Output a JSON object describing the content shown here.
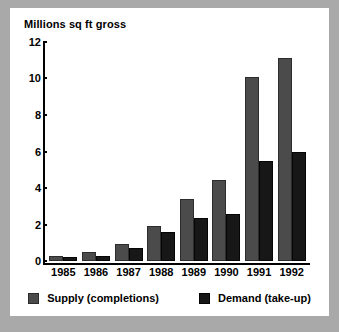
{
  "chart_data": {
    "type": "bar",
    "title": "Millions sq ft gross",
    "xlabel": "",
    "ylabel": "",
    "categories": [
      "1985",
      "1986",
      "1987",
      "1988",
      "1989",
      "1990",
      "1991",
      "1992"
    ],
    "series": [
      {
        "name": "Supply (completions)",
        "color": "#4b4b4b",
        "values": [
          0.25,
          0.5,
          0.95,
          1.9,
          3.4,
          4.45,
          10.1,
          11.1
        ]
      },
      {
        "name": "Demand (take-up)",
        "color": "#171717",
        "values": [
          0.2,
          0.3,
          0.7,
          1.6,
          2.35,
          2.6,
          5.5,
          6.0
        ]
      }
    ],
    "ylim": [
      0,
      12
    ],
    "yticks": [
      0,
      2,
      4,
      6,
      8,
      10,
      12
    ],
    "yticklabels": [
      "0",
      "2",
      "4",
      "6",
      "8",
      "10",
      "12"
    ],
    "grid": false,
    "legend_position": "bottom"
  },
  "colors": {
    "page_background": "#a9a9a9",
    "panel_background": "#ffffff",
    "axis": "#000000",
    "supply": "#4b4b4b",
    "demand": "#171717"
  }
}
